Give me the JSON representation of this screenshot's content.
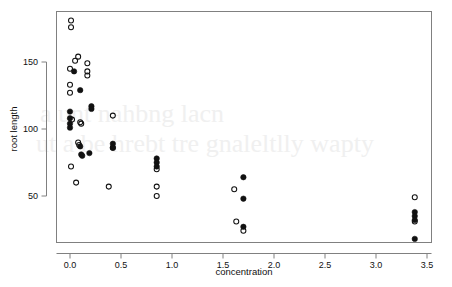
{
  "chart_data": {
    "type": "scatter",
    "title": "",
    "xlabel": "concentration",
    "ylabel": "root length",
    "xlim": [
      -0.18,
      3.66
    ],
    "ylim": [
      10,
      189
    ],
    "xticks": [
      0.0,
      0.5,
      1.0,
      1.5,
      2.0,
      2.5,
      3.0,
      3.5
    ],
    "xticklabels": [
      "0.0",
      "0.5",
      "1.0",
      "1.5",
      "2.0",
      "2.5",
      "3.0",
      "3.5"
    ],
    "yticks": [
      50,
      100,
      150
    ],
    "yticklabels": [
      "50",
      "100",
      "150"
    ],
    "grid": false,
    "legend": null,
    "series": [
      {
        "name": "open",
        "marker": "open-circle",
        "color": "#111111",
        "points": [
          [
            0.01,
            181
          ],
          [
            0.01,
            176
          ],
          [
            0.08,
            154
          ],
          [
            0.05,
            151
          ],
          [
            0.0,
            145
          ],
          [
            0.17,
            149
          ],
          [
            0.0,
            133
          ],
          [
            0.0,
            127
          ],
          [
            0.17,
            143
          ],
          [
            0.17,
            140
          ],
          [
            0.02,
            107
          ],
          [
            0.1,
            105
          ],
          [
            0.11,
            104
          ],
          [
            0.42,
            110
          ],
          [
            0.08,
            90
          ],
          [
            0.09,
            88
          ],
          [
            0.42,
            86
          ],
          [
            0.01,
            72
          ],
          [
            0.06,
            60
          ],
          [
            0.38,
            57
          ],
          [
            0.85,
            70
          ],
          [
            0.85,
            57
          ],
          [
            0.85,
            50
          ],
          [
            1.61,
            55
          ],
          [
            1.63,
            31
          ],
          [
            1.7,
            24
          ],
          [
            3.38,
            49
          ],
          [
            3.38,
            31
          ]
        ]
      },
      {
        "name": "filled",
        "marker": "filled-circle",
        "color": "#111111",
        "points": [
          [
            0.04,
            143
          ],
          [
            0.1,
            129
          ],
          [
            0.21,
            117
          ],
          [
            0.21,
            115
          ],
          [
            0.0,
            113
          ],
          [
            0.0,
            108
          ],
          [
            0.0,
            104
          ],
          [
            0.0,
            101
          ],
          [
            0.1,
            87
          ],
          [
            0.11,
            81
          ],
          [
            0.12,
            80
          ],
          [
            0.19,
            82
          ],
          [
            0.42,
            89
          ],
          [
            0.42,
            86
          ],
          [
            0.85,
            78
          ],
          [
            0.85,
            75
          ],
          [
            0.85,
            72
          ],
          [
            1.7,
            64
          ],
          [
            1.7,
            48
          ],
          [
            1.7,
            27
          ],
          [
            3.38,
            38
          ],
          [
            3.38,
            35
          ],
          [
            3.38,
            32
          ],
          [
            3.38,
            18
          ]
        ]
      }
    ]
  },
  "axes": {
    "xlabel": "concentration",
    "ylabel": "root length",
    "frame_color": "#808080",
    "marker_color": "#111111"
  },
  "ghost": {
    "line1": "a unt nahbng lacn",
    "line2": "ut a be hrebt tre gnaleltlly wapty"
  }
}
